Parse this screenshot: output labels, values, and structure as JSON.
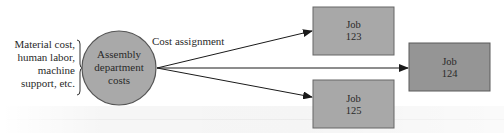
{
  "diagram": {
    "inputs_label": [
      "Material cost,",
      "human labor,",
      "machine",
      "support, etc."
    ],
    "source_node": {
      "lines": [
        "Assembly",
        "department",
        "costs"
      ],
      "fill": "#a9a9a9",
      "stroke": "#555555"
    },
    "edge_label": "Cost assignment",
    "targets": [
      {
        "id": "job-123",
        "lines": [
          "Job",
          "123"
        ],
        "fill": "#a8a8a8"
      },
      {
        "id": "job-124",
        "lines": [
          "Job",
          "124"
        ],
        "fill": "#959595"
      },
      {
        "id": "job-125",
        "lines": [
          "Job",
          "125"
        ],
        "fill": "#a8a8a8"
      }
    ],
    "edges": [
      {
        "from": "assembly-department-costs",
        "to": "job-123"
      },
      {
        "from": "assembly-department-costs",
        "to": "job-124"
      },
      {
        "from": "assembly-department-costs",
        "to": "job-125"
      }
    ]
  }
}
